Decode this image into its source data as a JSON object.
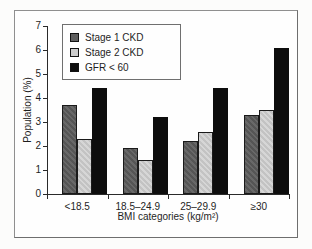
{
  "chart_data": {
    "type": "bar",
    "title": "",
    "categories": [
      "<18.5",
      "18.5–24.9",
      "25–29.9",
      "≥30"
    ],
    "series": [
      {
        "name": "Stage 1 CKD",
        "color": "#5e5e5e",
        "values": [
          3.7,
          1.9,
          2.2,
          3.3
        ]
      },
      {
        "name": "Stage 2 CKD",
        "color": "#cbcbcb",
        "values": [
          2.3,
          1.4,
          2.6,
          3.5
        ]
      },
      {
        "name": "GFR < 60",
        "color": "#0d0d0d",
        "values": [
          4.4,
          3.2,
          4.4,
          6.1
        ]
      }
    ],
    "xlabel": "BMI categories (kg/m²)",
    "ylabel": "Population (%)",
    "ylim": [
      0,
      7
    ],
    "yticks": [
      0,
      1,
      2,
      3,
      4,
      5,
      6,
      7
    ],
    "grid": false,
    "legend_position": "top-left"
  }
}
